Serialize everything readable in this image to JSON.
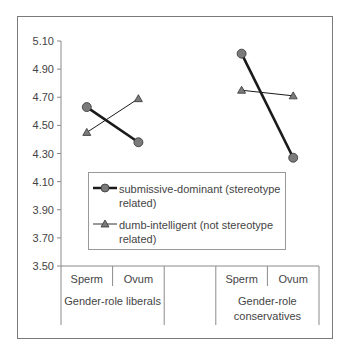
{
  "chart_data": {
    "type": "line",
    "title": "",
    "xlabel": "",
    "ylabel": "",
    "ylim": [
      3.5,
      5.1
    ],
    "yticks": [
      "5.10",
      "4.90",
      "4.70",
      "4.50",
      "4.30",
      "4.10",
      "3.90",
      "3.70",
      "3.50"
    ],
    "grid": false,
    "legend_position": "inside-lower-center",
    "groups": [
      {
        "label": "Gender-role liberals",
        "categories": [
          "Sperm",
          "Ovum"
        ]
      },
      {
        "label": "Gender-role conservatives",
        "categories": [
          "Sperm",
          "Ovum"
        ]
      }
    ],
    "series": [
      {
        "name": "submissive-dominant (stereotype related)",
        "marker": "circle",
        "line": "thick",
        "values": {
          "Gender-role liberals": [
            4.63,
            4.38
          ],
          "Gender-role conservatives": [
            5.01,
            4.27
          ]
        }
      },
      {
        "name": "dumb-intelligent (not stereotype related)",
        "marker": "triangle",
        "line": "thin",
        "values": {
          "Gender-role liberals": [
            4.45,
            4.69
          ],
          "Gender-role conservatives": [
            4.75,
            4.71
          ]
        }
      }
    ]
  },
  "colors": {
    "marker_fill": "#7a7a7a",
    "line": "#1a1a1a",
    "axis": "#8a8a8a"
  }
}
